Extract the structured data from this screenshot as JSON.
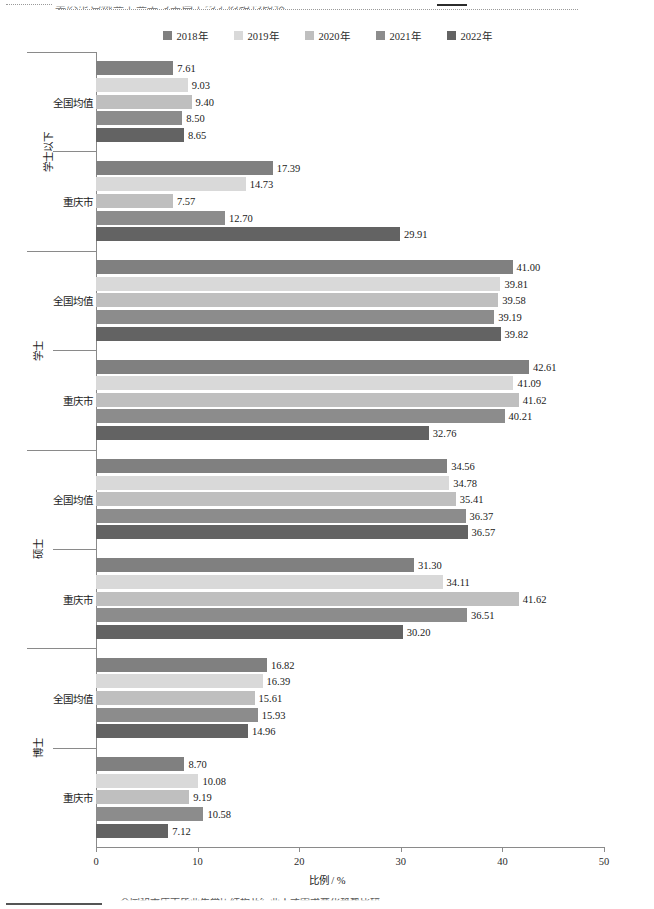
{
  "page": {
    "top_fragment_text": "重庆市已就业毕业生与全国平均学历结构比较",
    "bottom_caption_text": "全国和重庆市毕业生学历结构及行业人才需求变化趋势比较"
  },
  "chart_data": {
    "type": "bar",
    "orientation": "horizontal",
    "title": "",
    "xlabel": "比例 / %",
    "ylabel": "",
    "xlim": [
      0,
      50
    ],
    "xticks": [
      "0",
      "10",
      "20",
      "30",
      "40",
      "50"
    ],
    "grid": false,
    "legend_position": "top-center",
    "series": [
      {
        "name": "2018年",
        "color": "#808080"
      },
      {
        "name": "2019年",
        "color": "#d9d9d9"
      },
      {
        "name": "2020年",
        "color": "#bfbfbf"
      },
      {
        "name": "2021年",
        "color": "#8c8c8c"
      },
      {
        "name": "2022年",
        "color": "#636363"
      }
    ],
    "groups": [
      {
        "category": "学士以下",
        "subgroups": [
          {
            "label": "全国均值",
            "values": [
              7.61,
              9.03,
              9.4,
              8.5,
              8.65
            ]
          },
          {
            "label": "重庆市",
            "values": [
              17.39,
              14.73,
              7.57,
              12.7,
              29.91
            ]
          }
        ]
      },
      {
        "category": "学士",
        "subgroups": [
          {
            "label": "全国均值",
            "values": [
              41.0,
              39.81,
              39.58,
              39.19,
              39.82
            ]
          },
          {
            "label": "重庆市",
            "values": [
              42.61,
              41.09,
              41.62,
              40.21,
              32.76
            ]
          }
        ]
      },
      {
        "category": "硕士",
        "subgroups": [
          {
            "label": "全国均值",
            "values": [
              34.56,
              34.78,
              35.41,
              36.37,
              36.57
            ]
          },
          {
            "label": "重庆市",
            "values": [
              31.3,
              34.11,
              41.62,
              36.51,
              30.2
            ]
          }
        ]
      },
      {
        "category": "博士",
        "subgroups": [
          {
            "label": "全国均值",
            "values": [
              16.82,
              16.39,
              15.61,
              15.93,
              14.96
            ]
          },
          {
            "label": "重庆市",
            "values": [
              8.7,
              10.08,
              9.19,
              10.58,
              7.12
            ]
          }
        ]
      }
    ]
  }
}
